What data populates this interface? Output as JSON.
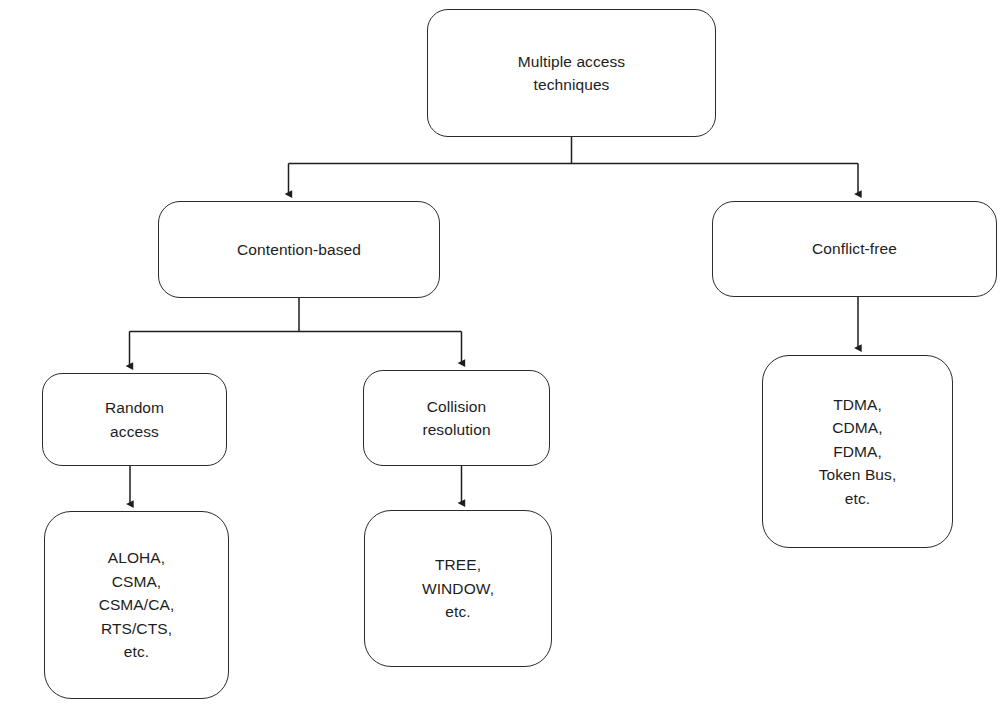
{
  "diagram": {
    "style": {
      "background_color": "#ffffff",
      "node_fill": "#ffffff",
      "node_stroke": "#2b2b2b",
      "text_color": "#1d1d1d",
      "edge_stroke": "#1d1d1d"
    },
    "nodes": {
      "root": {
        "label": "Multiple access\ntechniques",
        "lines": [
          "Multiple access",
          "techniques"
        ]
      },
      "contention": {
        "label": "Contention-based",
        "lines": [
          "Contention-based"
        ]
      },
      "conflict": {
        "label": "Conflict-free",
        "lines": [
          "Conflict-free"
        ]
      },
      "random": {
        "label": "Random\naccess",
        "lines": [
          "Random",
          "access"
        ]
      },
      "collision": {
        "label": "Collision\nresolution",
        "lines": [
          "Collision",
          "resolution"
        ]
      },
      "random_examples": {
        "label": "ALOHA,\nCSMA,\nCSMA/CA,\nRTS/CTS,\netc.",
        "lines": [
          "ALOHA,",
          "CSMA,",
          "CSMA/CA,",
          "RTS/CTS,",
          "etc."
        ]
      },
      "collision_examples": {
        "label": "TREE,\nWINDOW,\netc.",
        "lines": [
          "TREE,",
          "WINDOW,",
          "etc."
        ]
      },
      "conflict_examples": {
        "label": "TDMA,\nCDMA,\nFDMA,\nToken Bus,\netc.",
        "lines": [
          "TDMA,",
          "CDMA,",
          "FDMA,",
          "Token Bus,",
          "etc."
        ]
      }
    },
    "edges": [
      {
        "from": "root",
        "to": "contention",
        "type": "elbow-arrow"
      },
      {
        "from": "root",
        "to": "conflict",
        "type": "elbow-arrow"
      },
      {
        "from": "contention",
        "to": "random",
        "type": "elbow-arrow"
      },
      {
        "from": "contention",
        "to": "collision",
        "type": "elbow-arrow"
      },
      {
        "from": "random",
        "to": "random_examples",
        "type": "straight-arrow"
      },
      {
        "from": "collision",
        "to": "collision_examples",
        "type": "straight-arrow"
      },
      {
        "from": "conflict",
        "to": "conflict_examples",
        "type": "straight-arrow"
      }
    ]
  }
}
